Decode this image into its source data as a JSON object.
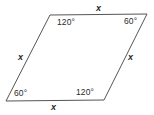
{
  "figure": {
    "type": "parallelogram",
    "stroke_color": "#555555",
    "text_color": "#2b2b2b",
    "background_color": "#ffffff",
    "vertices": {
      "top_left": {
        "x": 50,
        "y": 15
      },
      "top_right": {
        "x": 147,
        "y": 14
      },
      "bottom_right": {
        "x": 104,
        "y": 100
      },
      "bottom_left": {
        "x": 6,
        "y": 101
      }
    },
    "angles": {
      "top_left": "120°",
      "top_right": "60°",
      "bottom_right": "120°",
      "bottom_left": "60°"
    },
    "sides": {
      "top": "x",
      "right": "x",
      "bottom": "x",
      "left": "x"
    }
  }
}
